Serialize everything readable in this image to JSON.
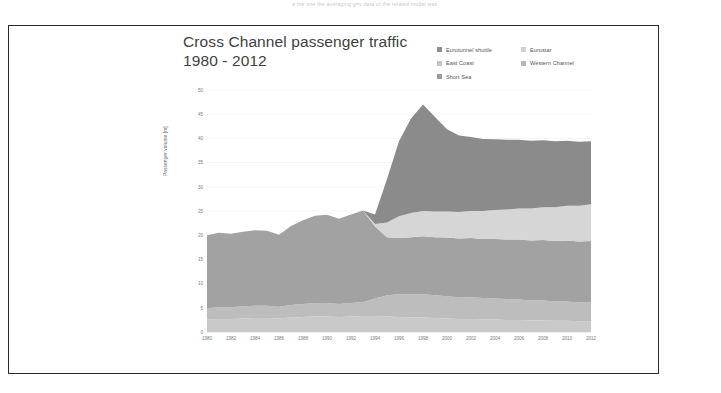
{
  "page": {
    "clipped_text_above": "a the one the averaging g=v data of the related model was"
  },
  "figure": {
    "title_line1": "Cross Channel passenger traffic",
    "title_line2": "1980 - 2012",
    "border_color": "#2b2b2b",
    "background": "#ffffff"
  },
  "legend": {
    "items": [
      {
        "label": "Eurotunnel shuttle",
        "color": "#8e8e8e"
      },
      {
        "label": "Eurostar",
        "color": "#d2d2d2"
      },
      {
        "label": "East Coast",
        "color": "#c4c4c4"
      },
      {
        "label": "Western Channel",
        "color": "#b6b6b6"
      },
      {
        "label": "Short Sea",
        "color": "#9b9b9b"
      }
    ]
  },
  "chart_data": {
    "type": "area",
    "stacked": true,
    "title": "Cross Channel passenger traffic 1980 - 2012",
    "xlabel": "",
    "ylabel": "Passenger volume [m]",
    "xlim": [
      1980,
      2012
    ],
    "ylim": [
      0,
      50
    ],
    "ytick_step": 5,
    "xtick_step": 2,
    "grid": true,
    "legend_position": "top-right",
    "yticks": [
      0,
      5,
      10,
      15,
      20,
      25,
      30,
      35,
      40,
      45,
      50
    ],
    "xticks": [
      1980,
      1982,
      1984,
      1986,
      1988,
      1990,
      1992,
      1994,
      1996,
      1998,
      2000,
      2002,
      2004,
      2006,
      2008,
      2010,
      2012
    ],
    "x": [
      1980,
      1981,
      1982,
      1983,
      1984,
      1985,
      1986,
      1987,
      1988,
      1989,
      1990,
      1991,
      1992,
      1993,
      1994,
      1995,
      1996,
      1997,
      1998,
      1999,
      2000,
      2001,
      2002,
      2003,
      2004,
      2005,
      2006,
      2007,
      2008,
      2009,
      2010,
      2011,
      2012
    ],
    "series": [
      {
        "name": "Western Channel",
        "color": "#c9c9c9",
        "values": [
          2.6,
          2.7,
          2.7,
          2.8,
          2.9,
          2.9,
          2.8,
          3.0,
          3.1,
          3.2,
          3.2,
          3.1,
          3.2,
          3.3,
          3.3,
          3.2,
          3.1,
          3.0,
          3.0,
          2.9,
          2.8,
          2.7,
          2.7,
          2.6,
          2.6,
          2.5,
          2.5,
          2.4,
          2.4,
          2.3,
          2.3,
          2.2,
          2.2
        ]
      },
      {
        "name": "East Coast",
        "color": "#bdbdbd",
        "values": [
          2.3,
          2.4,
          2.4,
          2.5,
          2.5,
          2.5,
          2.4,
          2.6,
          2.7,
          2.8,
          2.8,
          2.7,
          2.8,
          2.9,
          3.6,
          4.4,
          4.7,
          4.8,
          4.8,
          4.7,
          4.6,
          4.5,
          4.5,
          4.4,
          4.3,
          4.3,
          4.2,
          4.1,
          4.1,
          4.0,
          4.0,
          3.9,
          3.9
        ]
      },
      {
        "name": "Short Sea",
        "color": "#a2a2a2",
        "values": [
          15.1,
          15.4,
          15.2,
          15.4,
          15.6,
          15.5,
          14.9,
          16.3,
          17.3,
          18.0,
          18.2,
          17.6,
          18.3,
          18.9,
          14.9,
          12.0,
          11.6,
          11.8,
          12.0,
          12.0,
          12.1,
          12.1,
          12.2,
          12.2,
          12.3,
          12.3,
          12.4,
          12.4,
          12.5,
          12.5,
          12.6,
          12.6,
          12.7
        ]
      },
      {
        "name": "Eurostar",
        "color": "#d6d6d6",
        "values": [
          0,
          0,
          0,
          0,
          0,
          0,
          0,
          0,
          0,
          0,
          0,
          0,
          0,
          0,
          0.5,
          3.0,
          4.5,
          5.0,
          5.2,
          5.3,
          5.4,
          5.5,
          5.6,
          5.8,
          6.0,
          6.2,
          6.4,
          6.6,
          6.8,
          7.0,
          7.2,
          7.4,
          7.6
        ]
      },
      {
        "name": "Eurotunnel shuttle",
        "color": "#8b8b8b",
        "values": [
          0,
          0,
          0,
          0,
          0,
          0,
          0,
          0,
          0,
          0,
          0,
          0,
          0,
          0,
          2.0,
          9.0,
          15.5,
          19.5,
          22.0,
          19.5,
          17.0,
          15.8,
          15.3,
          14.9,
          14.6,
          14.4,
          14.2,
          14.0,
          13.8,
          13.6,
          13.4,
          13.2,
          13.0
        ]
      }
    ],
    "totals": [
      20.0,
      20.5,
      20.3,
      20.7,
      21.0,
      20.9,
      20.1,
      21.9,
      23.1,
      24.0,
      24.2,
      23.4,
      24.3,
      25.1,
      24.3,
      31.6,
      39.4,
      44.1,
      47.0,
      44.4,
      41.9,
      40.6,
      40.3,
      39.9,
      39.8,
      39.7,
      39.7,
      39.5,
      39.6,
      39.4,
      39.5,
      39.3,
      39.4
    ],
    "peak": {
      "year": 1998,
      "value": 47.0
    }
  }
}
